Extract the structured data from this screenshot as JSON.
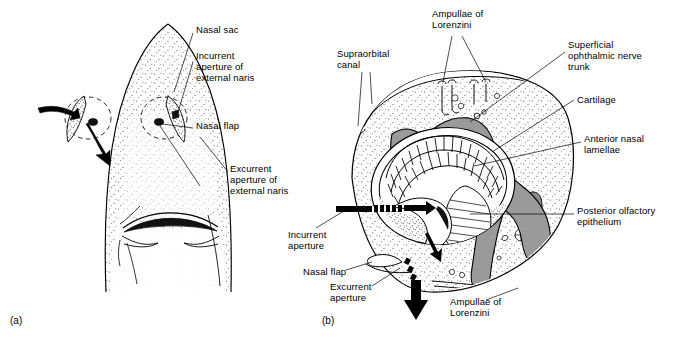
{
  "figure": {
    "type": "anatomical-diagram",
    "background_color": "#ffffff",
    "ink_color": "#000000",
    "cartilage_fill": "#9a9a9a",
    "stipple_color": "#6e6e6e"
  },
  "panels": [
    {
      "id": "a",
      "label": "(a)",
      "caption_view": "ventral view of shark snout",
      "x": 10,
      "y": 318
    },
    {
      "id": "b",
      "label": "(b)",
      "caption_view": "sagittal section through nasal sac",
      "x": 322,
      "y": 318
    }
  ],
  "labels_a": [
    {
      "name": "nasal-sac",
      "text": "Nasal sac",
      "x": 196,
      "y": 29,
      "lines": 1
    },
    {
      "name": "incurrent-aperture-external-naris",
      "text": "Incurrent\naperture of\nexternal naris",
      "x": 196,
      "y": 55,
      "lines": 3
    },
    {
      "name": "nasal-flap",
      "text": "Nasal flap",
      "x": 196,
      "y": 125,
      "lines": 1
    },
    {
      "name": "excurrent-aperture-external-naris",
      "text": "Excurrent\naperture of\nexternal naris",
      "x": 230,
      "y": 168,
      "lines": 3
    }
  ],
  "labels_b": [
    {
      "name": "ampullae-of-lorenzini-top",
      "text": "Ampullae of\nLorenzini",
      "x": 432,
      "y": 12,
      "lines": 2
    },
    {
      "name": "supraorbital-canal",
      "text": "Supraorbital\ncanal",
      "x": 337,
      "y": 52,
      "lines": 2
    },
    {
      "name": "superficial-ophthalmic-nerve-trunk",
      "text": "Superficial\nophthalmic nerve\ntrunk",
      "x": 568,
      "y": 43,
      "lines": 3
    },
    {
      "name": "cartilage",
      "text": "Cartilage",
      "x": 577,
      "y": 98,
      "lines": 1
    },
    {
      "name": "anterior-nasal-lamellae",
      "text": "Anterior nasal\nlamellae",
      "x": 584,
      "y": 137,
      "lines": 2
    },
    {
      "name": "posterior-olfactory-epithelium",
      "text": "Posterior olfactory\nepithelium",
      "x": 577,
      "y": 209,
      "lines": 2
    },
    {
      "name": "incurrent-aperture",
      "text": "Incurrent\naperture",
      "x": 288,
      "y": 233,
      "lines": 2
    },
    {
      "name": "nasal-flap-b",
      "text": "Nasal flap",
      "x": 303,
      "y": 271,
      "lines": 1
    },
    {
      "name": "excurrent-aperture",
      "text": "Excurrent\naperture",
      "x": 330,
      "y": 285,
      "lines": 2
    },
    {
      "name": "ampullae-of-lorenzini-bottom",
      "text": "Ampullae of\nLorenzini",
      "x": 450,
      "y": 300,
      "lines": 2
    }
  ],
  "flow": {
    "incurrent_arrow": "water enters through incurrent aperture",
    "excurrent_arrow": "water exits through excurrent aperture"
  }
}
